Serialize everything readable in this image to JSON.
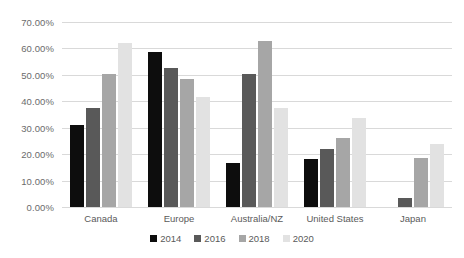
{
  "chart_data": {
    "type": "bar",
    "title": "",
    "subtitle": "",
    "xlabel": "",
    "ylabel": "",
    "categories": [
      "Canada",
      "Europe",
      "Australia/NZ",
      "United States",
      "Japan"
    ],
    "series": [
      {
        "name": "2014",
        "color": "#0d0d0d",
        "values": [
          31.0,
          58.5,
          16.5,
          18.0,
          0.0
        ]
      },
      {
        "name": "2016",
        "color": "#595959",
        "values": [
          37.5,
          52.5,
          50.5,
          22.0,
          3.5
        ]
      },
      {
        "name": "2018",
        "color": "#a6a6a6",
        "values": [
          50.5,
          48.5,
          63.0,
          26.0,
          18.5
        ]
      },
      {
        "name": "2020",
        "color": "#e2e2e2",
        "values": [
          62.0,
          41.5,
          37.5,
          33.5,
          24.0
        ]
      }
    ],
    "ylim": [
      0,
      70
    ],
    "ytick_labels": [
      "0.00%",
      "10.00%",
      "20.00%",
      "30.00%",
      "40.00%",
      "50.00%",
      "60.00%",
      "70.00%"
    ],
    "ytick_values": [
      0,
      10,
      20,
      30,
      40,
      50,
      60,
      70
    ],
    "grid": true,
    "grid_axis": "y",
    "legend_position": "bottom",
    "legend_entries": [
      "2014",
      "2016",
      "2018",
      "2020"
    ],
    "annotations": [],
    "background_color": "#ffffff",
    "gridline_color": "#d9d9d9",
    "text_color": "#5a5a5a"
  }
}
